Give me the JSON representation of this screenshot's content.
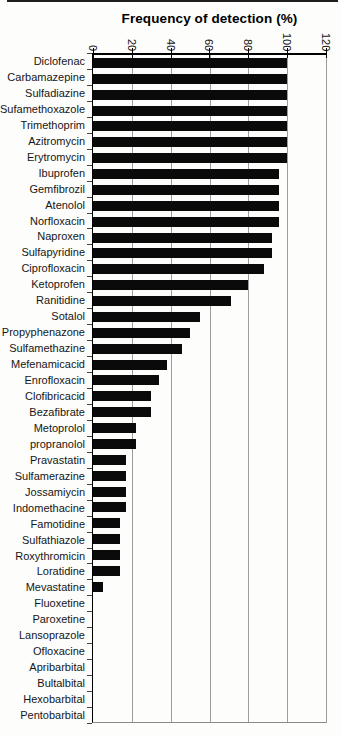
{
  "chart_data": {
    "type": "bar",
    "orientation": "horizontal",
    "title": "Frequency of detection (%)",
    "xlabel": "Frequency of detection (%)",
    "xlim": [
      0,
      120
    ],
    "x_ticks": [
      0,
      20,
      40,
      60,
      80,
      100,
      120
    ],
    "grid": true,
    "tick_label_rotation_deg": 90,
    "bar_color": "#0a0a0a",
    "gridline_color": "#9c9c9c",
    "axis_color": "#000000",
    "categories": [
      "Diclofenac",
      "Carbamazepine",
      "Sulfadiazine",
      "Sufamethoxazole",
      "Trimethoprim",
      "Azitromycin",
      "Erytromycin",
      "Ibuprofen",
      "Gemfibrozil",
      "Atenolol",
      "Norfloxacin",
      "Naproxen",
      "Sulfapyridine",
      "Ciprofloxacin",
      "Ketoprofen",
      "Ranitidine",
      "Sotalol",
      "Propyphenazone",
      "Sulfamethazine",
      "Mefenamicacid",
      "Enrofloxacin",
      "Clofibricacid",
      "Bezafibrate",
      "Metoprolol",
      "propranolol",
      "Pravastatin",
      "Sulfamerazine",
      "Jossamiycin",
      "Indomethacine",
      "Famotidine",
      "Sulfathiazole",
      "Roxythromicin",
      "Loratidine",
      "Mevastatine",
      "Fluoxetine",
      "Paroxetine",
      "Lansoprazole",
      "Ofloxacine",
      "Apribarbital",
      "Bultalbital",
      "Hexobarbital",
      "Pentobarbital"
    ],
    "values": [
      100,
      100,
      100,
      100,
      100,
      100,
      100,
      96,
      96,
      96,
      96,
      92,
      92,
      88,
      80,
      71,
      55,
      50,
      46,
      38,
      34,
      30,
      30,
      22,
      22,
      17,
      17,
      17,
      17,
      14,
      14,
      14,
      14,
      5,
      0,
      0,
      0,
      0,
      0,
      0,
      0,
      0
    ]
  }
}
